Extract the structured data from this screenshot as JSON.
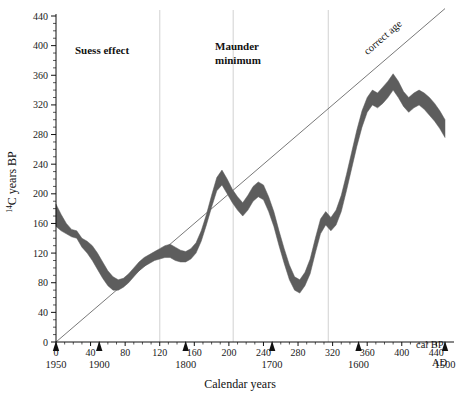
{
  "chart_data": {
    "type": "area",
    "title": "",
    "xlabel": "Calendar years",
    "ylabel": "14C years BP",
    "ylabel_parts": {
      "sup": "14",
      "rest": "C years BP"
    },
    "xlim": [
      0,
      450
    ],
    "ylim": [
      0,
      440
    ],
    "grid": false,
    "x_unit_label": "cal BP",
    "x_secondary_unit_label": "AD",
    "x_ticks": [
      0,
      40,
      80,
      120,
      160,
      200,
      240,
      280,
      320,
      360,
      400,
      440
    ],
    "x_tick_labels": [
      "0",
      "40",
      "80",
      "120",
      "160",
      "200",
      "240",
      "280",
      "320",
      "360",
      "400",
      "440"
    ],
    "x_minor_tick_step": 10,
    "y_ticks": [
      0,
      40,
      80,
      120,
      160,
      200,
      240,
      280,
      320,
      360,
      400,
      440
    ],
    "y_tick_labels": [
      "0",
      "40",
      "80",
      "120",
      "160",
      "200",
      "240",
      "280",
      "320",
      "360",
      "400",
      "440"
    ],
    "y_minor_tick_step": 10,
    "secondary_x_axis": {
      "label": "AD",
      "markers": [
        {
          "cal_bp": 0,
          "ad_year": "1950"
        },
        {
          "cal_bp": 50,
          "ad_year": "1900"
        },
        {
          "cal_bp": 150,
          "ad_year": "1800"
        },
        {
          "cal_bp": 250,
          "ad_year": "1700"
        },
        {
          "cal_bp": 350,
          "ad_year": "1600"
        },
        {
          "cal_bp": 450,
          "ad_year": "1500"
        }
      ]
    },
    "annotations": [
      {
        "name": "suess-effect",
        "text": "Suess effect",
        "x": 75,
        "y": 393
      },
      {
        "name": "maunder-minimum",
        "text": "Maunder\nminimum",
        "line1": "Maunder",
        "line2": "minimum",
        "x": 215,
        "y": 398
      },
      {
        "name": "correct-age",
        "text": "correct age",
        "x": 385,
        "y": 420,
        "rotation_deg": -41
      }
    ],
    "reference_line": {
      "name": "correct age",
      "label": "correct age",
      "from": [
        0,
        0
      ],
      "to": [
        450,
        450
      ],
      "slope": 1,
      "color": "#555555"
    },
    "vertical_gridlines": {
      "color": "#d9d9d9",
      "x_values": [
        120,
        205,
        315
      ]
    },
    "band": {
      "name": "radiocarbon calibration curve envelope",
      "fill_color": "#5d5d5d",
      "x": [
        0,
        6,
        12,
        18,
        24,
        30,
        36,
        42,
        48,
        54,
        60,
        66,
        72,
        78,
        84,
        90,
        96,
        102,
        108,
        114,
        120,
        126,
        132,
        138,
        144,
        150,
        156,
        162,
        168,
        174,
        180,
        186,
        192,
        198,
        204,
        210,
        216,
        222,
        228,
        234,
        240,
        246,
        252,
        258,
        264,
        270,
        276,
        282,
        288,
        294,
        300,
        306,
        312,
        318,
        324,
        330,
        336,
        342,
        348,
        354,
        360,
        366,
        372,
        378,
        384,
        390,
        396,
        402,
        408,
        414,
        420,
        426,
        432,
        438,
        444,
        450
      ],
      "upper": [
        186,
        172,
        160,
        152,
        150,
        140,
        136,
        130,
        120,
        108,
        96,
        88,
        84,
        86,
        92,
        100,
        108,
        114,
        118,
        122,
        126,
        130,
        132,
        128,
        124,
        122,
        126,
        134,
        150,
        172,
        198,
        222,
        232,
        220,
        206,
        196,
        188,
        198,
        210,
        216,
        212,
        196,
        176,
        150,
        126,
        104,
        88,
        84,
        94,
        112,
        140,
        166,
        176,
        168,
        178,
        198,
        226,
        256,
        286,
        312,
        330,
        340,
        336,
        344,
        352,
        362,
        352,
        338,
        330,
        336,
        340,
        336,
        330,
        322,
        312,
        300
      ],
      "lower": [
        156,
        150,
        146,
        142,
        140,
        128,
        120,
        110,
        98,
        86,
        76,
        70,
        70,
        74,
        80,
        88,
        96,
        102,
        106,
        110,
        112,
        114,
        114,
        110,
        108,
        108,
        112,
        120,
        136,
        158,
        182,
        204,
        212,
        200,
        188,
        178,
        170,
        178,
        190,
        196,
        192,
        176,
        156,
        130,
        106,
        84,
        70,
        66,
        76,
        92,
        120,
        146,
        158,
        150,
        158,
        176,
        204,
        234,
        264,
        290,
        310,
        320,
        316,
        322,
        330,
        340,
        330,
        318,
        310,
        316,
        320,
        314,
        306,
        298,
        288,
        276
      ],
      "description": "Shaded envelope of radiocarbon age versus calendar age, showing the Suess effect near present and the Maunder minimum wiggle"
    }
  }
}
